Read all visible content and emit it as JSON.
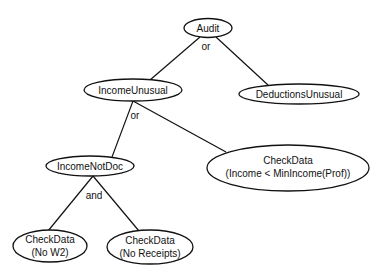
{
  "diagram": {
    "type": "fault-tree",
    "nodes": {
      "audit": {
        "label": "Audit"
      },
      "income_unusual": {
        "label": "IncomeUnusual"
      },
      "deductions_unusual": {
        "label": "DeductionsUnusual"
      },
      "income_not_doc": {
        "label": "IncomeNotDoc"
      },
      "check_income": {
        "line1": "CheckData",
        "line2": "(Income < MinIncome(Prof))"
      },
      "check_w2": {
        "line1": "CheckData",
        "line2": "(No W2)"
      },
      "check_receipts": {
        "line1": "CheckData",
        "line2": "(No Receipts)"
      }
    },
    "connectors": {
      "audit_gate": "or",
      "income_unusual_gate": "or",
      "income_not_doc_gate": "and"
    },
    "edges": [
      {
        "from": "Audit",
        "to": "IncomeUnusual"
      },
      {
        "from": "Audit",
        "to": "DeductionsUnusual"
      },
      {
        "from": "IncomeUnusual",
        "to": "IncomeNotDoc"
      },
      {
        "from": "IncomeUnusual",
        "to": "CheckData (Income < MinIncome(Prof))"
      },
      {
        "from": "IncomeNotDoc",
        "to": "CheckData (No W2)"
      },
      {
        "from": "IncomeNotDoc",
        "to": "CheckData (No Receipts)"
      }
    ]
  }
}
